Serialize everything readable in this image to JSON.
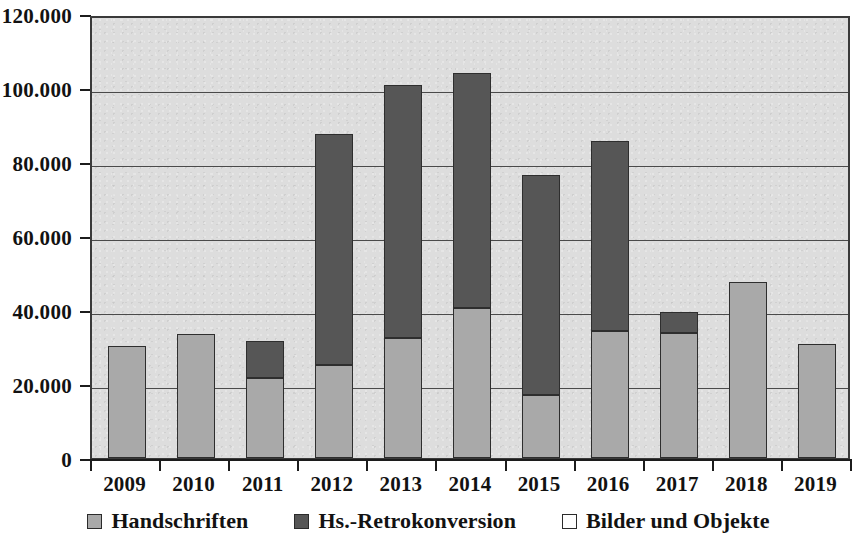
{
  "chart_data": {
    "type": "bar",
    "stacked": true,
    "title": "",
    "subtitle": "",
    "xlabel": "",
    "ylabel": "",
    "categories": [
      "2009",
      "2010",
      "2011",
      "2012",
      "2013",
      "2014",
      "2015",
      "2016",
      "2017",
      "2018",
      "2019"
    ],
    "series": [
      {
        "name": "Handschriften",
        "color": "#a9a9a9",
        "values": [
          30300,
          33500,
          21600,
          25100,
          32400,
          40500,
          17000,
          34300,
          33800,
          47500,
          30800
        ]
      },
      {
        "name": "Hs.-Retrokonversion",
        "color": "#565656",
        "values": [
          0,
          0,
          10000,
          62500,
          68400,
          63500,
          59500,
          51400,
          5700,
          0,
          0
        ]
      },
      {
        "name": "Bilder und Objekte",
        "color": "#ffffff",
        "values": [
          0,
          0,
          0,
          0,
          0,
          0,
          0,
          0,
          0,
          0,
          0
        ]
      }
    ],
    "totals": [
      30300,
      33500,
      31600,
      87600,
      100800,
      104000,
      76500,
      85700,
      39500,
      47500,
      30800
    ],
    "ylim": [
      0,
      120000
    ],
    "yticks": [
      0,
      20000,
      40000,
      60000,
      80000,
      100000,
      120000
    ],
    "ytick_labels": [
      "0",
      "20.000",
      "40.000",
      "60.000",
      "80.000",
      "100.000",
      "120.000"
    ],
    "grid": true,
    "legend_position": "bottom",
    "plot_background": "#dddddd"
  },
  "legend": {
    "entries": [
      {
        "label": "Handschriften",
        "swatch": "handschriften"
      },
      {
        "label": "Hs.-Retrokonversion",
        "swatch": "retro"
      },
      {
        "label": "Bilder und Objekte",
        "swatch": "bilder"
      }
    ]
  }
}
